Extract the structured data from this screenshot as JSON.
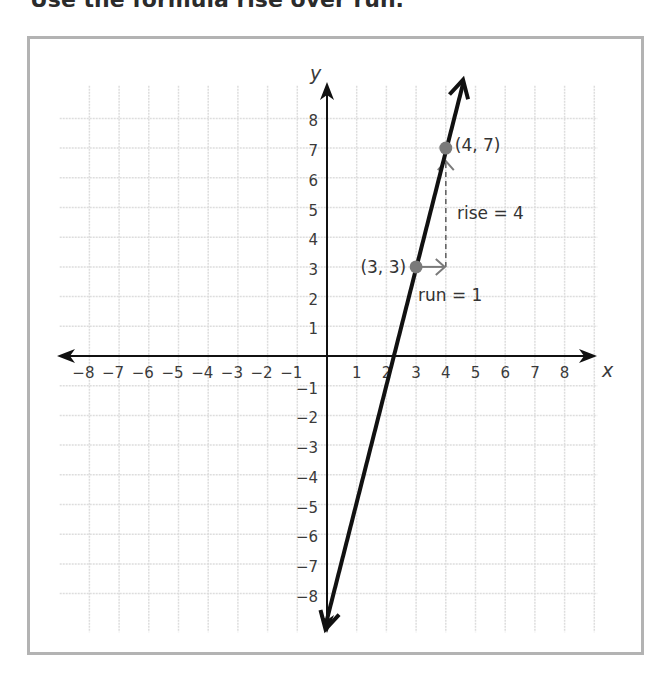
{
  "heading": {
    "text": "Use the formula rise over run."
  },
  "chart_data": {
    "type": "line",
    "title": "",
    "xlabel": "x",
    "ylabel": "y",
    "xlim": [
      -9,
      9
    ],
    "ylim": [
      -9,
      9
    ],
    "grid": true,
    "x_ticks": [
      "−8",
      "−7",
      "−6",
      "−5",
      "−4",
      "−3",
      "−2",
      "−1",
      "1",
      "2",
      "3",
      "4",
      "5",
      "6",
      "7",
      "8"
    ],
    "y_ticks": [
      "8",
      "7",
      "6",
      "5",
      "4",
      "3",
      "2",
      "1",
      "−1",
      "−2",
      "−3",
      "−4",
      "−5",
      "−6",
      "−7",
      "−8"
    ],
    "series": [
      {
        "name": "line",
        "equation": "y = 4x − 9",
        "x": [
          -0.05,
          4.58
        ],
        "y": [
          -9.2,
          9.3
        ]
      }
    ],
    "points": [
      {
        "label": "(3, 3)",
        "x": 3,
        "y": 3
      },
      {
        "label": "(4, 7)",
        "x": 4,
        "y": 7
      }
    ],
    "annotations": [
      {
        "text": "rise = 4",
        "type": "dashed-vertical",
        "from": [
          4,
          3
        ],
        "to": [
          4,
          7
        ]
      },
      {
        "text": "run = 1",
        "type": "arrow-horizontal",
        "from": [
          3,
          3
        ],
        "to": [
          4,
          3
        ]
      }
    ],
    "colors": {
      "line": "#111111",
      "axes": "#111111",
      "grid": "#dddddd",
      "points": "#7a7a7a",
      "frame": "#b3b3b3"
    }
  }
}
